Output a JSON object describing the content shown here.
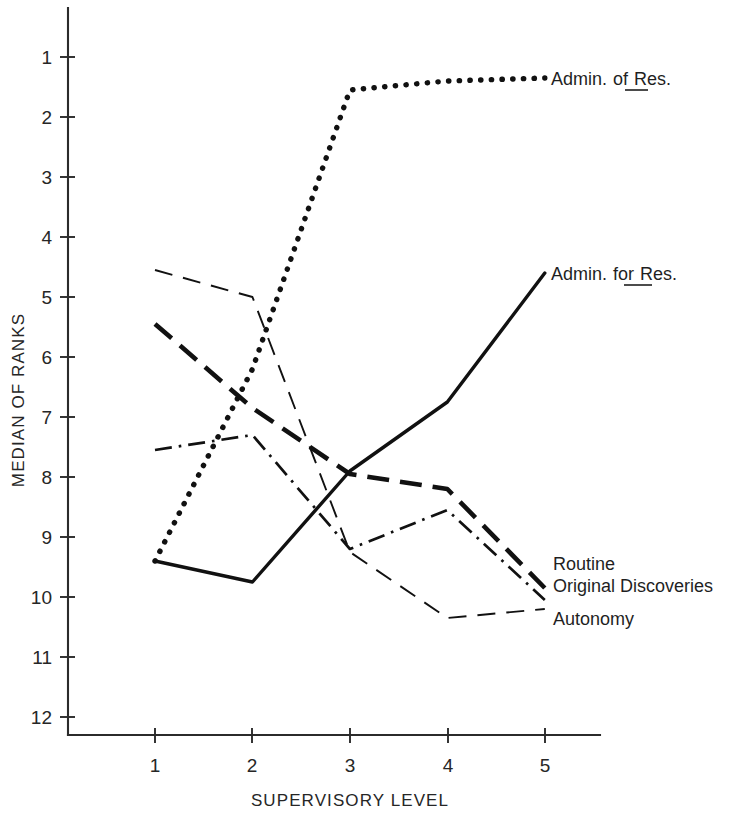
{
  "chart_data": {
    "type": "line",
    "title": "",
    "subtitle": "",
    "xlabel": "SUPERVISORY LEVEL",
    "ylabel": "MEDIAN OF RANKS",
    "x": [
      1,
      2,
      3,
      4,
      5
    ],
    "xtick_labels": [
      "1",
      "2",
      "3",
      "4",
      "5"
    ],
    "ytick_labels": [
      "1",
      "2",
      "3",
      "4",
      "5",
      "6",
      "7",
      "8",
      "9",
      "10",
      "11",
      "12"
    ],
    "ytick_values": [
      1,
      2,
      3,
      4,
      5,
      6,
      7,
      8,
      9,
      10,
      11,
      12
    ],
    "xlim": [
      0.55,
      5.45
    ],
    "ylim": [
      12.6,
      0.35
    ],
    "y_axis_inverted": true,
    "grid": false,
    "legend_position": "right-inline-annotations",
    "series": [
      {
        "name": "Admin. of Res.",
        "label_plain": "Admin. of Res.",
        "label_underlined_word": "of",
        "line_style": "dotted",
        "values": [
          9.4,
          6.2,
          1.55,
          1.4,
          1.35
        ]
      },
      {
        "name": "Admin. for Res.",
        "label_plain": "Admin. for Res.",
        "label_underlined_word": "for",
        "line_style": "solid",
        "values": [
          9.4,
          9.75,
          7.9,
          6.75,
          4.6
        ]
      },
      {
        "name": "Routine",
        "label_plain": "Routine",
        "label_underlined_word": "",
        "line_style": "thick-dash",
        "values": [
          5.45,
          6.85,
          7.95,
          8.2,
          9.85
        ]
      },
      {
        "name": "Original Discoveries",
        "label_plain": "Original Discoveries",
        "label_underlined_word": "",
        "line_style": "dash-dot",
        "values": [
          7.55,
          7.3,
          9.2,
          8.55,
          10.05
        ]
      },
      {
        "name": "Autonomy",
        "label_plain": "Autonomy",
        "label_underlined_word": "",
        "line_style": "thin-dash",
        "values": [
          4.55,
          5.0,
          9.25,
          10.35,
          10.2
        ]
      }
    ]
  },
  "annotations": {
    "admin_of_res": "Admin. of Res.",
    "admin_of_res_pre": "Admin.",
    "admin_of_res_mid": "of",
    "admin_of_res_post": "Res.",
    "admin_for_res": "Admin. for Res.",
    "admin_for_res_pre": "Admin.",
    "admin_for_res_mid": "for",
    "admin_for_res_post": "Res.",
    "routine": "Routine",
    "original_discoveries": "Original Discoveries",
    "autonomy": "Autonomy"
  },
  "axes": {
    "x_title": "SUPERVISORY LEVEL",
    "y_title": "MEDIAN OF RANKS",
    "x_ticks": [
      "1",
      "2",
      "3",
      "4",
      "5"
    ],
    "y_ticks": [
      "1",
      "2",
      "3",
      "4",
      "5",
      "6",
      "7",
      "8",
      "9",
      "10",
      "11",
      "12"
    ]
  },
  "colors": {
    "ink": "#111111",
    "axis": "#2b2b2b",
    "background": "#ffffff",
    "text": "#262626"
  }
}
